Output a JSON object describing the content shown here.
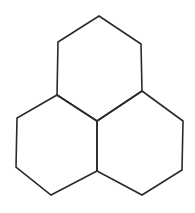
{
  "diagram": {
    "title": "Three fused hexagons",
    "stroke_color": "#2a2a2a",
    "background": "#ffffff",
    "stroke_width": 1.6,
    "rings": [
      {
        "name": "top",
        "points": "99,16 141,44 142,91 97,121 57,95 58,42"
      },
      {
        "name": "left",
        "points": "57,95 97,121 97,171 51,195 16,167 17,118"
      },
      {
        "name": "right",
        "points": "142,91 183,121 182,170 142,195 97,171 97,121"
      }
    ]
  }
}
